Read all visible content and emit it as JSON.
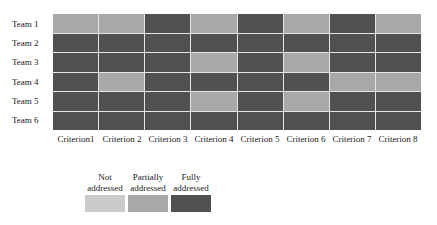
{
  "chart_data": {
    "type": "heatmap",
    "title": "",
    "xlabel": "",
    "ylabel": "",
    "rows": [
      "Team 1",
      "Team 2",
      "Team 3",
      "Team 4",
      "Team 5",
      "Team 6"
    ],
    "columns": [
      "Criterion1",
      "Criterion 2",
      "Criterion 3",
      "Criterion 4",
      "Criterion 5",
      "Criterion 6",
      "Criterion 7",
      "Criterion 8"
    ],
    "levels": [
      {
        "key": "not",
        "label_line1": "Not",
        "label_line2": "addressed",
        "color": "#cbcbcb"
      },
      {
        "key": "partial",
        "label_line1": "Partially",
        "label_line2": "addressed",
        "color": "#a8a8a8"
      },
      {
        "key": "full",
        "label_line1": "Fully",
        "label_line2": "addressed",
        "color": "#515151"
      }
    ],
    "values": [
      [
        "partial",
        "partial",
        "full",
        "partial",
        "full",
        "partial",
        "full",
        "partial"
      ],
      [
        "full",
        "full",
        "full",
        "full",
        "full",
        "full",
        "full",
        "full"
      ],
      [
        "full",
        "full",
        "full",
        "partial",
        "full",
        "partial",
        "full",
        "full"
      ],
      [
        "full",
        "partial",
        "full",
        "full",
        "full",
        "full",
        "partial",
        "partial"
      ],
      [
        "full",
        "full",
        "full",
        "partial",
        "full",
        "partial",
        "full",
        "full"
      ],
      [
        "full",
        "full",
        "full",
        "full",
        "full",
        "full",
        "full",
        "full"
      ]
    ],
    "legend_position": "bottom-left",
    "grid": true
  }
}
